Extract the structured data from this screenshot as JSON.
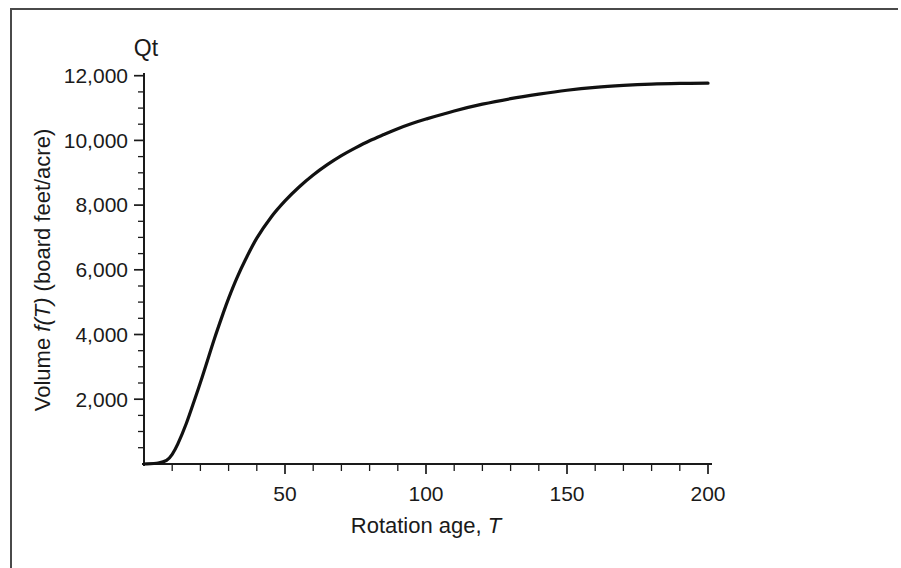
{
  "figure": {
    "corner_label": "Qt",
    "frame_color": "#4a4a4a",
    "curve_color": "#111111",
    "background": "#ffffff"
  },
  "axes": {
    "x_title_prefix": "Rotation age, ",
    "x_title_symbol": "T",
    "y_title_prefix": "Volume ",
    "y_title_symbol": "f(T)",
    "y_title_suffix": " (board feet/acre)",
    "x_tick_labels": [
      "50",
      "100",
      "150",
      "200"
    ],
    "y_tick_labels": [
      "2,000",
      "4,000",
      "6,000",
      "8,000",
      "10,000",
      "12,000"
    ]
  },
  "chart_data": {
    "type": "line",
    "title": "Qt",
    "xlabel": "Rotation age, T",
    "ylabel": "Volume f(T) (board feet/acre)",
    "xlim": [
      0,
      205
    ],
    "ylim": [
      0,
      12000
    ],
    "grid": false,
    "legend": null,
    "x_major_ticks": [
      50,
      100,
      150,
      200
    ],
    "x_minor_tick_interval": 10,
    "y_major_ticks": [
      2000,
      4000,
      6000,
      8000,
      10000,
      12000
    ],
    "y_minor_tick_interval": 500,
    "series": [
      {
        "name": "f(T)",
        "x": [
          0,
          5,
          8,
          10,
          12,
          15,
          18,
          20,
          22,
          25,
          28,
          30,
          33,
          36,
          40,
          45,
          50,
          55,
          60,
          65,
          70,
          75,
          80,
          85,
          90,
          95,
          100,
          110,
          120,
          130,
          140,
          150,
          160,
          170,
          180,
          190,
          200
        ],
        "values": [
          0,
          30,
          110,
          300,
          620,
          1250,
          2000,
          2520,
          3060,
          3880,
          4640,
          5120,
          5760,
          6320,
          6980,
          7620,
          8130,
          8560,
          8930,
          9250,
          9530,
          9770,
          9990,
          10180,
          10360,
          10520,
          10660,
          10910,
          11120,
          11290,
          11430,
          11550,
          11640,
          11700,
          11740,
          11760,
          11770
        ]
      }
    ]
  }
}
